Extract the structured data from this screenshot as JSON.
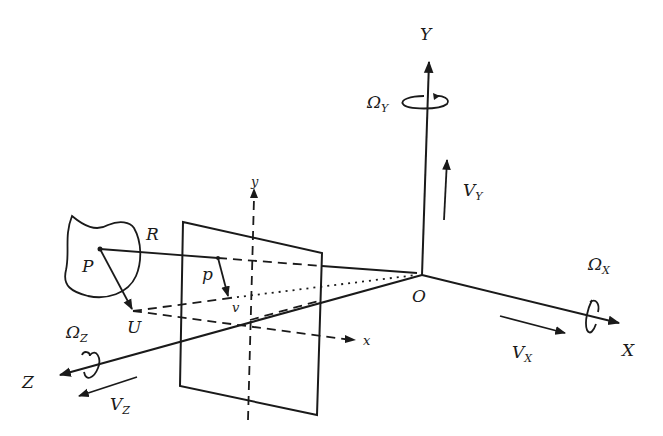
{
  "diagram": {
    "world_axes": {
      "X": "X",
      "Y": "Y",
      "Z": "Z",
      "origin": "O"
    },
    "rotations": {
      "omega_x": {
        "symbol": "Ω",
        "sub": "X"
      },
      "omega_y": {
        "symbol": "Ω",
        "sub": "Y"
      },
      "omega_z": {
        "symbol": "Ω",
        "sub": "Z"
      }
    },
    "translations": {
      "v_x": {
        "symbol": "V",
        "sub": "X"
      },
      "v_y": {
        "symbol": "V",
        "sub": "Y"
      },
      "v_z": {
        "symbol": "V",
        "sub": "Z"
      }
    },
    "image_plane": {
      "x_axis": "x",
      "y_axis": "y"
    },
    "points": {
      "P": "P",
      "p": "p",
      "U": "U",
      "v": "v",
      "R": "R"
    }
  }
}
